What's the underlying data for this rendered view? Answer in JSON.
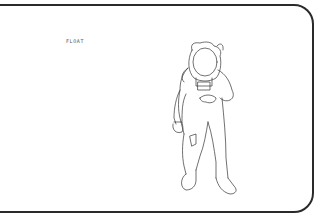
{
  "card": {
    "caption": "FLOAT"
  },
  "illustration": {
    "subject": "astronaut-in-spacesuit",
    "style": "black line drawing"
  },
  "colors": {
    "background": "#ffffff",
    "stroke": "#2a2a2a"
  }
}
